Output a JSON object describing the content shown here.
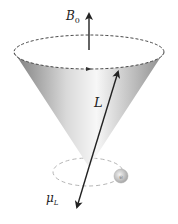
{
  "diagram": {
    "labels": {
      "field": "B",
      "field_sub": "0",
      "angular_momentum": "L",
      "magnetic_moment": "μ",
      "magnetic_moment_sub": "L",
      "electron": "e"
    },
    "colors": {
      "arrow": "#222222",
      "cone_dark": "#8a8a8a",
      "cone_light": "#f4f4f4",
      "dashed": "#333333",
      "orbit": "#b0b0b0",
      "electron": "#c8c8c8"
    }
  }
}
